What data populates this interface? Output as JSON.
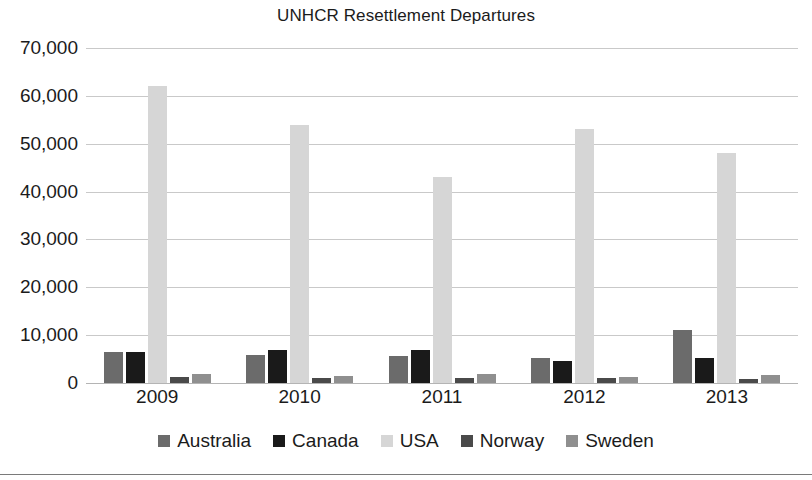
{
  "chart_data": {
    "type": "bar",
    "title": "UNHCR Resettlement Departures",
    "xlabel": "",
    "ylabel": "",
    "categories": [
      "2009",
      "2010",
      "2011",
      "2012",
      "2013"
    ],
    "series": [
      {
        "name": "Australia",
        "color": "#6b6b6b",
        "values": [
          6500,
          5800,
          5600,
          5200,
          11000
        ]
      },
      {
        "name": "Canada",
        "color": "#1a1a1a",
        "values": [
          6500,
          6800,
          6800,
          4700,
          5200
        ]
      },
      {
        "name": "USA",
        "color": "#d6d6d6",
        "values": [
          62000,
          54000,
          43000,
          53000,
          48000
        ]
      },
      {
        "name": "Norway",
        "color": "#4a4a4a",
        "values": [
          1300,
          1100,
          1100,
          1100,
          900
        ]
      },
      {
        "name": "Sweden",
        "color": "#8f8f8f",
        "values": [
          1800,
          1500,
          1800,
          1300,
          1700
        ]
      }
    ],
    "ylim": [
      0,
      70000
    ],
    "ytick_values": [
      70000,
      60000,
      50000,
      40000,
      30000,
      20000,
      10000,
      0
    ],
    "ytick_labels": [
      "70,000",
      "60,000",
      "50,000",
      "40,000",
      "30,000",
      "20,000",
      "10,000",
      "0"
    ],
    "grid": true,
    "legend_position": "bottom"
  }
}
